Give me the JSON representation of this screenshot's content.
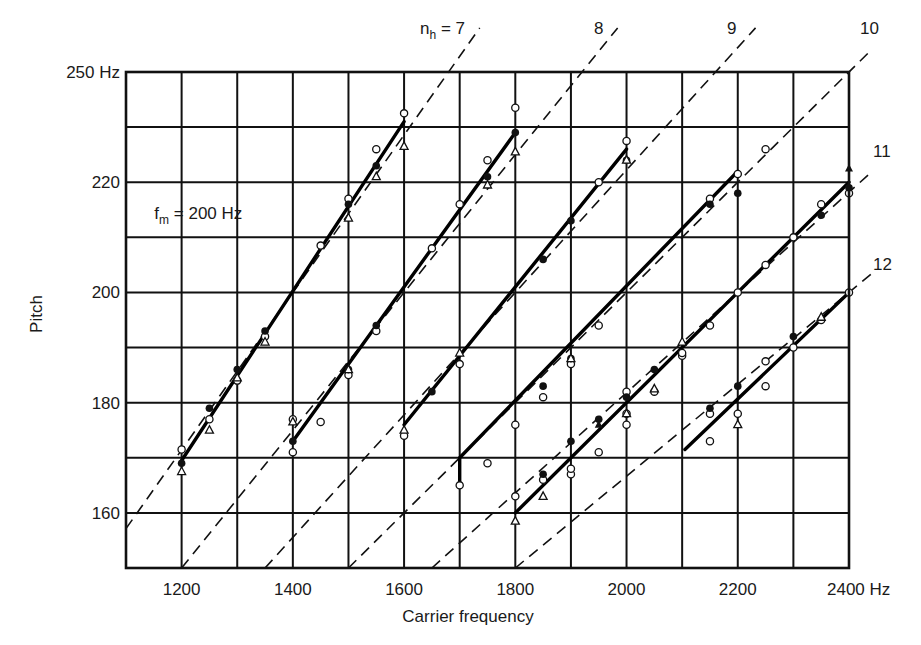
{
  "chart_data": {
    "type": "line",
    "title": "",
    "xlabel": "Carrier frequency",
    "ylabel": "Pitch",
    "xlim": [
      1100,
      2400
    ],
    "ylim": [
      150,
      240
    ],
    "grid": true,
    "x_grid_step": 100,
    "y_grid_step": 10,
    "x_tick_labels": [
      {
        "value": 1200,
        "label": "1200"
      },
      {
        "value": 1400,
        "label": "1400"
      },
      {
        "value": 1600,
        "label": "1600"
      },
      {
        "value": 1800,
        "label": "1800"
      },
      {
        "value": 2000,
        "label": "2000"
      },
      {
        "value": 2200,
        "label": "2200"
      },
      {
        "value": 2400,
        "label": "2400 Hz"
      }
    ],
    "y_tick_labels": [
      {
        "value": 160,
        "label": "160"
      },
      {
        "value": 180,
        "label": "180"
      },
      {
        "value": 200,
        "label": "200"
      },
      {
        "value": 220,
        "label": "220"
      },
      {
        "value": 240,
        "label": "250 Hz"
      }
    ],
    "annotation": {
      "text_main": "f",
      "text_sub": "m",
      "text_rest": " = 200 Hz",
      "x": 1115,
      "y": 214.5
    },
    "harmonic_lines": {
      "style": "dashed",
      "formula": "pitch = carrier / n",
      "items": [
        {
          "n": 7,
          "label": "n",
          "label_sub": "h",
          "label_rest": " = 7",
          "label_pos": [
            420,
            34
          ]
        },
        {
          "n": 8,
          "label": "8",
          "label_pos": [
            594,
            34
          ]
        },
        {
          "n": 9,
          "label": "9",
          "label_pos": [
            727,
            34
          ]
        },
        {
          "n": 10,
          "label": "10",
          "label_pos": [
            860,
            34
          ]
        },
        {
          "n": 11,
          "label": "11",
          "label_pos": [
            873,
            157
          ]
        },
        {
          "n": 12,
          "label": "12",
          "label_pos": [
            873,
            270
          ]
        }
      ]
    },
    "series": [
      {
        "name": "fitted pitch segment 1",
        "style": "solid",
        "points": [
          [
            1200,
            169.5
          ],
          [
            1600,
            231
          ]
        ]
      },
      {
        "name": "fitted pitch segment 2",
        "style": "solid",
        "points": [
          [
            1400,
            173
          ],
          [
            1800,
            229
          ]
        ]
      },
      {
        "name": "fitted pitch segment 3",
        "style": "solid",
        "points": [
          [
            1600,
            176
          ],
          [
            2000,
            226
          ]
        ]
      },
      {
        "name": "fitted pitch segment 4",
        "style": "solid",
        "points": [
          [
            1700,
            165.5
          ],
          [
            1700,
            170
          ],
          [
            2200,
            222
          ]
        ]
      },
      {
        "name": "fitted pitch segment 5",
        "style": "solid",
        "points": [
          [
            1800,
            160
          ],
          [
            2400,
            220
          ]
        ]
      },
      {
        "name": "fitted pitch segment 6",
        "style": "solid",
        "points": [
          [
            2105,
            171.5
          ],
          [
            2400,
            200
          ]
        ]
      }
    ],
    "markers": {
      "open_circle": [
        [
          1200,
          171.5
        ],
        [
          1250,
          177
        ],
        [
          1300,
          184
        ],
        [
          1350,
          192
        ],
        [
          1450,
          208.5
        ],
        [
          1500,
          217
        ],
        [
          1550,
          226
        ],
        [
          1600,
          232.5
        ],
        [
          1400,
          171
        ],
        [
          1400,
          177
        ],
        [
          1450,
          176.5
        ],
        [
          1500,
          185
        ],
        [
          1550,
          193
        ],
        [
          1650,
          208
        ],
        [
          1700,
          216
        ],
        [
          1750,
          224
        ],
        [
          1800,
          233.5
        ],
        [
          1600,
          174
        ],
        [
          1700,
          187
        ],
        [
          1750,
          169
        ],
        [
          1800,
          176
        ],
        [
          1850,
          181
        ],
        [
          1900,
          187
        ],
        [
          1950,
          194
        ],
        [
          1950,
          220
        ],
        [
          2000,
          227.5
        ],
        [
          1700,
          165
        ],
        [
          1800,
          163
        ],
        [
          1850,
          166
        ],
        [
          1900,
          167
        ],
        [
          1950,
          171
        ],
        [
          2000,
          176
        ],
        [
          2000,
          182
        ],
        [
          2050,
          182
        ],
        [
          2100,
          188.5
        ],
        [
          2150,
          194
        ],
        [
          2150,
          217
        ],
        [
          2200,
          221.5
        ],
        [
          2250,
          226
        ],
        [
          1900,
          168
        ],
        [
          2000,
          178
        ],
        [
          2100,
          189
        ],
        [
          2150,
          178
        ],
        [
          2200,
          178
        ],
        [
          2250,
          183
        ],
        [
          2300,
          190
        ],
        [
          2350,
          195
        ],
        [
          2400,
          200
        ],
        [
          2350,
          216
        ],
        [
          2400,
          218
        ],
        [
          2250,
          205
        ],
        [
          2300,
          210
        ],
        [
          2150,
          173
        ],
        [
          2250,
          187.5
        ],
        [
          2200,
          200
        ]
      ],
      "filled_circle": [
        [
          1200,
          169
        ],
        [
          1250,
          179
        ],
        [
          1300,
          186
        ],
        [
          1350,
          193
        ],
        [
          1500,
          216
        ],
        [
          1550,
          223
        ],
        [
          1400,
          173
        ],
        [
          1500,
          186
        ],
        [
          1550,
          194
        ],
        [
          1650,
          182
        ],
        [
          1750,
          221
        ],
        [
          1800,
          229
        ],
        [
          1850,
          183
        ],
        [
          1900,
          188
        ],
        [
          1950,
          177
        ],
        [
          1850,
          206
        ],
        [
          1900,
          213
        ],
        [
          2000,
          224
        ],
        [
          1850,
          167
        ],
        [
          1900,
          173
        ],
        [
          2000,
          181
        ],
        [
          2050,
          186
        ],
        [
          2150,
          216
        ],
        [
          2200,
          218
        ],
        [
          2150,
          179
        ],
        [
          2200,
          183
        ],
        [
          2300,
          192
        ],
        [
          2350,
          214
        ],
        [
          2400,
          219
        ]
      ],
      "open_triangle": [
        [
          1200,
          167.5
        ],
        [
          1250,
          175
        ],
        [
          1300,
          184.5
        ],
        [
          1350,
          191
        ],
        [
          1500,
          213.5
        ],
        [
          1550,
          221
        ],
        [
          1600,
          226.5
        ],
        [
          1400,
          176.5
        ],
        [
          1500,
          186
        ],
        [
          1600,
          175
        ],
        [
          1700,
          189
        ],
        [
          1750,
          219.5
        ],
        [
          1800,
          225.5
        ],
        [
          1800,
          158.5
        ],
        [
          1850,
          163
        ],
        [
          1900,
          188
        ],
        [
          2000,
          178
        ],
        [
          2050,
          182.5
        ],
        [
          2000,
          224
        ],
        [
          2100,
          191
        ],
        [
          2200,
          176
        ],
        [
          2350,
          195.5
        ]
      ],
      "filled_triangle": [
        [
          2400,
          222.5
        ],
        [
          1950,
          176
        ]
      ]
    }
  }
}
